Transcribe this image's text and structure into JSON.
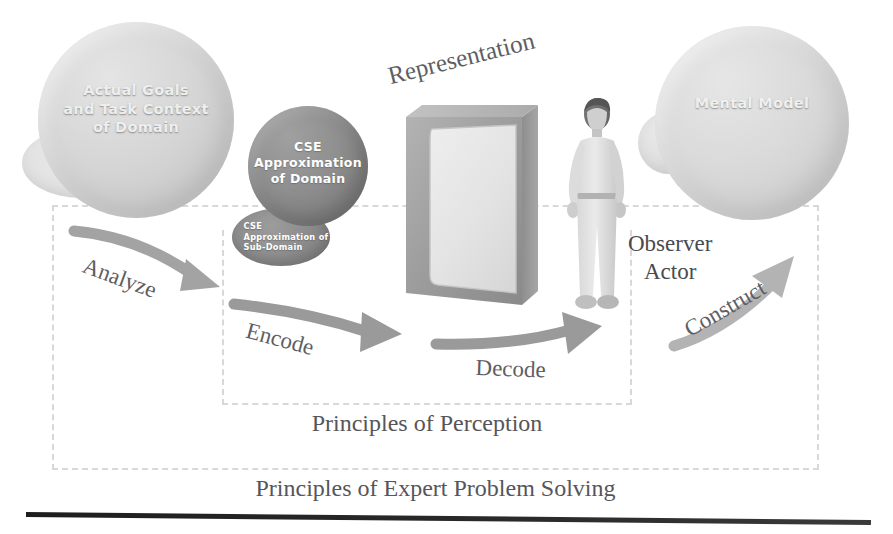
{
  "diagram": {
    "nodes": {
      "domain": {
        "label": "Actual Goals\nand Task Context\nof Domain",
        "line1": "Actual Goals",
        "line2": "and Task Context",
        "line3": "of Domain",
        "color": "#d2d2d2"
      },
      "domain_sub": {
        "line1": "Human",
        "line2": "Imposed",
        "line3": "Sub-Domain",
        "color": "#e1e1e1"
      },
      "cse": {
        "line1": "CSE",
        "line2": "Approximation",
        "line3": "of Domain",
        "color": "#868686"
      },
      "cse_sub": {
        "line1": "CSE",
        "line2": "Approximation of",
        "line3": "Sub-Domain",
        "color": "#8b8b8b"
      },
      "representation": {
        "label": "Representation",
        "frame_color": "#9a9a9a",
        "screen_color": "#e2e2e2"
      },
      "observer": {
        "line1": "Observer",
        "line2": "Actor"
      },
      "mental_model": {
        "label": "Mental Model",
        "color": "#d6d6d6"
      }
    },
    "arrows": [
      {
        "name": "analyze",
        "label": "Analyze",
        "from": "domain",
        "to": "cse"
      },
      {
        "name": "encode",
        "label": "Encode",
        "from": "cse",
        "to": "representation"
      },
      {
        "name": "decode",
        "label": "Decode",
        "from": "representation",
        "to": "observer"
      },
      {
        "name": "construct",
        "label": "Construct",
        "from": "observer",
        "to": "mental_model"
      }
    ],
    "boundaries": [
      {
        "name": "inner",
        "caption": "Principles of Perception"
      },
      {
        "name": "outer",
        "caption": "Principles of Expert Problem Solving"
      }
    ],
    "captions": {
      "perception": "Principles of Perception",
      "expert": "Principles of Expert Problem Solving"
    },
    "colors": {
      "arrow": "#9b9b9b",
      "text": "#55555a",
      "dashed_border": "#d8d8dc",
      "rule": "#222222"
    }
  }
}
